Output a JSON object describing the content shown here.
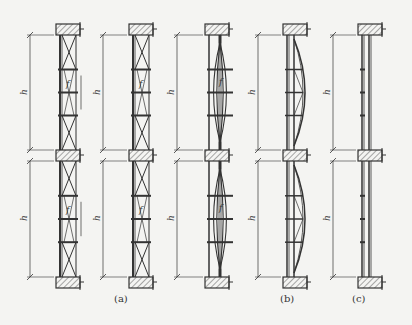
{
  "figure": {
    "captions": [
      {
        "id": "a",
        "text": "(a)",
        "x": 114,
        "y": 293
      },
      {
        "id": "b",
        "text": "(b)",
        "x": 280,
        "y": 293
      },
      {
        "id": "c",
        "text": "(c)",
        "x": 352,
        "y": 293
      }
    ],
    "height_label": "h",
    "sag_label": "f",
    "columns": [
      {
        "id": "col1",
        "type": "x-braced-truss",
        "slab_x": 56,
        "dim_x": 30,
        "group": "a"
      },
      {
        "id": "col2",
        "type": "x-braced-truss-offset",
        "slab_x": 129,
        "dim_x": 103,
        "group": "a"
      },
      {
        "id": "col3",
        "type": "lens-shaped-prestressed",
        "slab_x": 205,
        "dim_x": 177,
        "group": "b"
      },
      {
        "id": "col4",
        "type": "bow-string",
        "slab_x": 283,
        "dim_x": 258,
        "group": "b"
      },
      {
        "id": "col5",
        "type": "plain-strut",
        "slab_x": 358,
        "dim_x": 333,
        "group": "c"
      }
    ],
    "slab_rows_y": [
      24,
      150,
      277
    ],
    "colors": {
      "ink": "#333333",
      "paper": "#f4f4f2",
      "hatch": "#555555"
    }
  }
}
